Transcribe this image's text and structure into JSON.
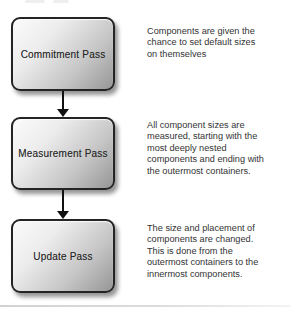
{
  "diagram": {
    "colors": {
      "background": "#ffffff",
      "box_border": "#242424",
      "box_gradient_start": "#fbfbfb",
      "box_gradient_end": "#969696",
      "box_text": "#2a2a2a",
      "paragraph_text": "#333333",
      "arrow": "#111111",
      "divider": "#d2d2d2"
    },
    "steps": [
      {
        "label": "Commitment Pass",
        "description": "Components are given the\nchance to set default sizes\non themselves"
      },
      {
        "label": "Measurement Pass",
        "description": "All component sizes are\nmeasured, starting with the\nmost deeply nested\ncomponents and ending with\nthe outermost containers."
      },
      {
        "label": "Update Pass",
        "description": "The size and placement of\ncomponents are changed.\nThis is done from the\noutermost containers to the\ninnermost components."
      }
    ]
  }
}
